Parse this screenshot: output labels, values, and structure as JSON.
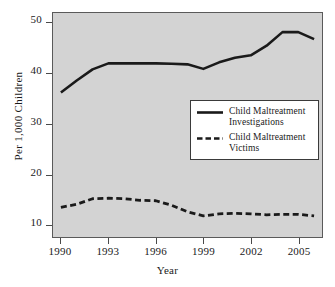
{
  "chart_data": {
    "type": "line",
    "title": "",
    "xlabel": "Year",
    "ylabel": "Per 1,000 Children",
    "xlim": [
      1989.5,
      2006.5
    ],
    "ylim": [
      7.5,
      52
    ],
    "grid": false,
    "legend_position": "center-right",
    "xticks": [
      "1990",
      "1993",
      "1996",
      "1999",
      "2002",
      "2005"
    ],
    "xtick_values": [
      1990,
      1993,
      1996,
      1999,
      2002,
      2005
    ],
    "yticks": [
      "10",
      "20",
      "30",
      "40",
      "50"
    ],
    "ytick_values": [
      10,
      20,
      30,
      40,
      50
    ],
    "x": [
      1990,
      1991,
      1992,
      1993,
      1994,
      1995,
      1996,
      1997,
      1998,
      1999,
      2000,
      2001,
      2002,
      2003,
      2004,
      2005,
      2006
    ],
    "series": [
      {
        "name": "Child Maltreatment Investigations",
        "style": "solid",
        "color": "#1a1a1a",
        "values": [
          36.2,
          38.6,
          40.8,
          42.0,
          42.0,
          42.0,
          42.0,
          41.9,
          41.8,
          40.9,
          42.2,
          43.1,
          43.6,
          45.5,
          48.2,
          48.2,
          46.8
        ]
      },
      {
        "name": "Child Maltreatment Victims",
        "style": "dashed",
        "color": "#1a1a1a",
        "values": [
          13.4,
          14.0,
          15.1,
          15.2,
          15.1,
          14.8,
          14.7,
          13.8,
          12.5,
          11.7,
          12.1,
          12.2,
          12.1,
          11.9,
          12.0,
          12.0,
          11.7
        ]
      }
    ]
  },
  "legend": {
    "entries": [
      {
        "label": "Child Maltreatment\nInvestigations",
        "style": "solid"
      },
      {
        "label": "Child Maltreatment\nVictims",
        "style": "dashed"
      }
    ]
  },
  "colors": {
    "plot_background": "#d3d3d3",
    "page_background": "#ffffff",
    "line": "#1a1a1a",
    "axis": "#4a4a4a",
    "legend_background": "#ffffff",
    "legend_border": "#3a3a3a"
  }
}
